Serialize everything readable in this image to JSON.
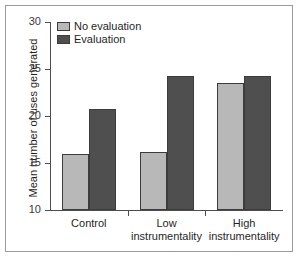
{
  "chart_data": {
    "type": "bar",
    "title": "",
    "subtitle": "",
    "xlabel": "",
    "ylabel": "Mean number of uses generated",
    "ylim": [
      10,
      30
    ],
    "ytick_labels": [
      "10",
      "15",
      "20",
      "25",
      "30"
    ],
    "ytick_values": [
      10,
      15,
      20,
      25,
      30
    ],
    "grid": false,
    "legend_position": "top-left",
    "categories": [
      "Control",
      "Low instrumentality",
      "High instrumentality"
    ],
    "category_lines": [
      {
        "line1": "Control",
        "line2": ""
      },
      {
        "line1": "Low",
        "line2": "instrumentality"
      },
      {
        "line1": "High",
        "line2": "instrumentality"
      }
    ],
    "series": [
      {
        "name": "No evaluation",
        "color": "#b8b8b8",
        "values": [
          16.0,
          16.2,
          23.5
        ]
      },
      {
        "name": "Evaluation",
        "color": "#4f4f4f",
        "values": [
          20.7,
          24.3,
          24.3
        ]
      }
    ]
  },
  "legend": {
    "items": [
      {
        "label": "No evaluation",
        "swatch": "light-gray-swatch"
      },
      {
        "label": "Evaluation",
        "swatch": "dark-gray-swatch"
      }
    ]
  },
  "axes": {
    "y_title": "Mean number of uses generated"
  },
  "colors": {
    "light_bar": "#b8b8b8",
    "dark_bar": "#4f4f4f",
    "axis": "#4d4d4d",
    "frame": "#9a9a9a",
    "text": "#1f1f1f"
  }
}
